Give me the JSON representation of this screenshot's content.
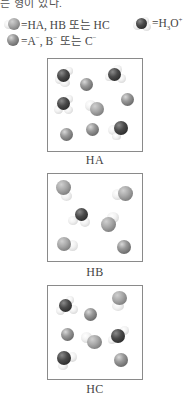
{
  "intro_text": "는 형이 있다.",
  "legend": {
    "acid": {
      "symbol": "sphere-with-hydrogen",
      "text": "=HA, HB 또는 HC"
    },
    "hydronium": {
      "symbol": "dark-sphere-with-hydrogens",
      "text_prefix": "=H",
      "sub": "3",
      "mid": "O",
      "sup": "+"
    },
    "anion": {
      "symbol": "grey-sphere",
      "text_prefix": "=A",
      "sup1": "−",
      "mid1": ", B",
      "sup2": "−",
      "mid2": " 또는 C",
      "sup3": "−"
    }
  },
  "panels": [
    {
      "label": "HA",
      "contents": {
        "hydronium": 3,
        "anion": 5,
        "acid": 1
      }
    },
    {
      "label": "HB",
      "contents": {
        "hydronium": 1,
        "anion": 1,
        "acid": 4
      }
    },
    {
      "label": "HC",
      "contents": {
        "hydronium": 3,
        "anion": 4,
        "acid": 2
      }
    }
  ]
}
